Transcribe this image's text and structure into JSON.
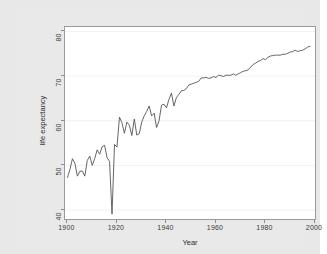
{
  "chart_data": {
    "type": "line",
    "title": "",
    "xlabel": "Year",
    "ylabel": "life expectancy",
    "xlim": [
      1899,
      2000
    ],
    "ylim": [
      38,
      81
    ],
    "xticks": [
      1900,
      1920,
      1940,
      1960,
      1980,
      2000
    ],
    "xtick_labels": [
      "1900",
      "1920",
      "1940",
      "1960",
      "1980",
      "2000"
    ],
    "yticks": [
      40,
      50,
      60,
      70,
      80
    ],
    "ytick_labels": [
      "40",
      "50",
      "60",
      "70",
      "80"
    ],
    "grid": true,
    "legend": null,
    "line_color": "#555555",
    "series": [
      {
        "name": "life expectancy",
        "x": [
          1900,
          1901,
          1902,
          1903,
          1904,
          1905,
          1906,
          1907,
          1908,
          1909,
          1910,
          1911,
          1912,
          1913,
          1914,
          1915,
          1916,
          1917,
          1918,
          1919,
          1920,
          1921,
          1922,
          1923,
          1924,
          1925,
          1926,
          1927,
          1928,
          1929,
          1930,
          1931,
          1932,
          1933,
          1934,
          1935,
          1936,
          1937,
          1938,
          1939,
          1940,
          1941,
          1942,
          1943,
          1944,
          1945,
          1946,
          1947,
          1948,
          1949,
          1950,
          1951,
          1952,
          1953,
          1954,
          1955,
          1956,
          1957,
          1958,
          1959,
          1960,
          1961,
          1962,
          1963,
          1964,
          1965,
          1966,
          1967,
          1968,
          1969,
          1970,
          1971,
          1972,
          1973,
          1974,
          1975,
          1976,
          1977,
          1978,
          1979,
          1980,
          1981,
          1982,
          1983,
          1984,
          1985,
          1986,
          1987,
          1988,
          1989,
          1990,
          1991,
          1992,
          1993,
          1994,
          1995,
          1996,
          1997,
          1998
        ],
        "values": [
          47.3,
          49.1,
          51.5,
          50.5,
          47.6,
          48.7,
          48.7,
          47.6,
          51.1,
          52.1,
          50.0,
          51.5,
          53.5,
          52.5,
          54.2,
          54.5,
          51.7,
          50.9,
          39.1,
          54.7,
          54.1,
          60.8,
          59.6,
          57.2,
          59.7,
          59.0,
          56.7,
          60.4,
          56.8,
          57.1,
          59.7,
          61.1,
          62.1,
          63.3,
          61.1,
          61.7,
          58.5,
          60.0,
          63.5,
          63.7,
          62.9,
          64.8,
          66.2,
          63.3,
          65.2,
          65.9,
          66.7,
          66.8,
          67.2,
          68.0,
          68.2,
          68.4,
          68.6,
          68.8,
          69.6,
          69.6,
          69.7,
          69.5,
          69.6,
          69.9,
          69.7,
          70.2,
          70.1,
          69.9,
          70.2,
          70.2,
          70.2,
          70.5,
          70.2,
          70.5,
          70.8,
          71.1,
          71.2,
          71.4,
          72.0,
          72.6,
          72.9,
          73.3,
          73.5,
          73.9,
          73.7,
          74.2,
          74.5,
          74.6,
          74.7,
          74.7,
          74.7,
          74.9,
          74.9,
          75.1,
          75.4,
          75.5,
          75.8,
          75.5,
          75.7,
          75.8,
          76.1,
          76.5,
          76.7
        ]
      }
    ]
  },
  "axis": {
    "ylabel_text": "life expectancy",
    "xlabel_text": "Year"
  }
}
